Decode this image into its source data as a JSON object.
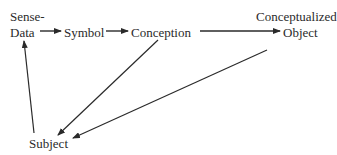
{
  "diagram": {
    "nodes": {
      "sense_data_line1": "Sense-",
      "sense_data_line2": "Data",
      "symbol": "Symbol",
      "conception": "Conception",
      "conceptualized_object_line1": "Conceptualized",
      "conceptualized_object_line2": "Object",
      "subject": "Subject"
    },
    "edges": [
      {
        "from": "Sense-Data",
        "to": "Symbol"
      },
      {
        "from": "Symbol",
        "to": "Conception"
      },
      {
        "from": "Conception",
        "to": "Conceptualized Object"
      },
      {
        "from": "Conception",
        "to": "Subject"
      },
      {
        "from": "Conceptualized Object",
        "to": "Subject"
      },
      {
        "from": "Subject",
        "to": "Sense-Data"
      }
    ],
    "colors": {
      "ink": "#2a2a2a",
      "background": "#ffffff"
    }
  }
}
